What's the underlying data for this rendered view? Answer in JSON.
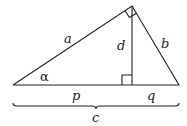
{
  "diagram": {
    "type": "right-triangle-with-altitude",
    "labels": {
      "a": "a",
      "b": "b",
      "c": "c",
      "d": "d",
      "p": "p",
      "q": "q",
      "alpha": "α"
    },
    "colors": {
      "stroke": "#222222",
      "background": "#ffffff"
    }
  }
}
